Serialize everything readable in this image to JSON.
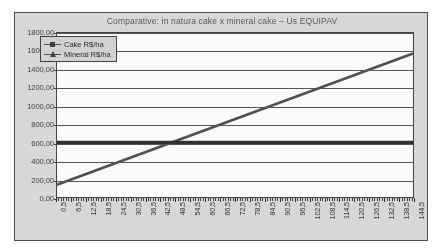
{
  "chart_data": {
    "type": "line",
    "title": "Comparative: in natura cake x mineral cake – Us EQUIPAV",
    "xlabel": "",
    "ylabel": "",
    "ylim": [
      0,
      1800
    ],
    "ytick_step": 200,
    "ytick_labels": [
      "1800,00",
      "1600,00",
      "1400,00",
      "1200,00",
      "1000,00",
      "800,00",
      "600,00",
      "400,00",
      "200,00",
      "0,00"
    ],
    "ytick_values": [
      1800,
      1600,
      1400,
      1200,
      1000,
      800,
      600,
      400,
      200,
      0
    ],
    "xlim": [
      0.5,
      144.5
    ],
    "xtick_step": 6,
    "xtick_labels": [
      "0,5",
      "6,5",
      "12,5",
      "18,5",
      "24,5",
      "30,5",
      "36,5",
      "42,5",
      "48,5",
      "54,5",
      "60,5",
      "66,5",
      "72,5",
      "78,5",
      "84,5",
      "90,5",
      "96,5",
      "102,5",
      "108,5",
      "114,5",
      "120,5",
      "126,5",
      "132,5",
      "138,5",
      "144,5"
    ],
    "xtick_values": [
      0.5,
      6.5,
      12.5,
      18.5,
      24.5,
      30.5,
      36.5,
      42.5,
      48.5,
      54.5,
      60.5,
      66.5,
      72.5,
      78.5,
      84.5,
      90.5,
      96.5,
      102.5,
      108.5,
      114.5,
      120.5,
      126.5,
      132.5,
      138.5,
      144.5
    ],
    "grid": true,
    "legend_position": "upper left",
    "series": [
      {
        "name": "Cake R$/ha",
        "marker": "square",
        "color": "#4b4b4b",
        "x": [
          0.5,
          144.5
        ],
        "values": [
          135,
          1575
        ]
      },
      {
        "name": "Mineral R$/ha",
        "marker": "triangle",
        "color": "#2b2b2b",
        "x": [
          0.5,
          144.5
        ],
        "values": [
          600,
          600
        ]
      }
    ],
    "annotations": {
      "crossover_x": 48.5,
      "crossover_y": 600
    }
  },
  "legend": {
    "items": [
      {
        "label": "Cake R$/ha",
        "marker": "square-marker-icon"
      },
      {
        "label": "Mineral R$/ha",
        "marker": "triangle-marker-icon"
      }
    ]
  }
}
